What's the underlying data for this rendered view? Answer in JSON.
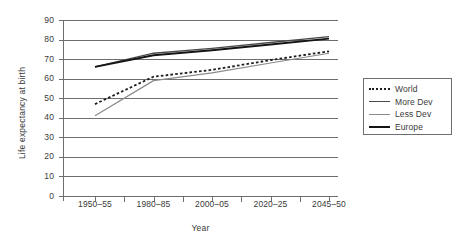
{
  "chart_data": {
    "type": "line",
    "title": "",
    "xlabel": "Year",
    "ylabel": "Life expectancy at birth",
    "ylim": [
      0,
      90
    ],
    "ytick_step": 10,
    "yticks": [
      90,
      80,
      70,
      60,
      50,
      40,
      30,
      20,
      10,
      0
    ],
    "grid": "horizontal",
    "legend_position": "right-outside",
    "categories": [
      "1950–55",
      "1980–85",
      "2000–05",
      "2020–25",
      "2045–50"
    ],
    "x": [
      1952.5,
      1982.5,
      2002.5,
      2022.5,
      2047.5
    ],
    "series": [
      {
        "name": "World",
        "style": "dotted",
        "color": "#1c1c1c",
        "width": 1.8,
        "values": [
          47,
          61,
          64.5,
          69.5,
          74
        ]
      },
      {
        "name": "More Dev",
        "style": "solid",
        "color": "#4a4a4a",
        "width": 1.3,
        "values": [
          66,
          73,
          75.5,
          78.5,
          81.5
        ]
      },
      {
        "name": "Less Dev",
        "style": "solid",
        "color": "#8a8a8a",
        "width": 1.2,
        "values": [
          41,
          59,
          63,
          68,
          73
        ]
      },
      {
        "name": "Europe",
        "style": "solid",
        "color": "#151515",
        "width": 1.9,
        "values": [
          66,
          72,
          74.5,
          77.5,
          80.5
        ]
      }
    ]
  },
  "axes": {
    "y_title": "Life expectancy at birth",
    "x_title": "Year"
  },
  "legend": {
    "entries": [
      {
        "label": "World",
        "icon": "dotted-line-swatch"
      },
      {
        "label": "More Dev",
        "icon": "solid-line-swatch"
      },
      {
        "label": "Less Dev",
        "icon": "light-line-swatch"
      },
      {
        "label": "Europe",
        "icon": "bold-line-swatch"
      }
    ]
  },
  "colors": {
    "axis": "#6e6e6e",
    "grid": "#6e6e6e",
    "text": "#3a3a3a",
    "background": "#ffffff"
  }
}
